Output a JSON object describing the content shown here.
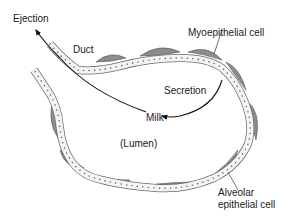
{
  "diagram": {
    "labels": {
      "ejection": "Ejection",
      "duct": "Duct",
      "myoepithelial_cell": "Myoepithelial cell",
      "secretion": "Secretion",
      "milk": "Milk",
      "lumen": "(Lumen)",
      "alveolar_line1": "Alveolar",
      "alveolar_line2": "epithelial cell"
    },
    "colors": {
      "background": "#ffffff",
      "epithelial_fill": "#f4f4f4",
      "epithelial_stroke": "#6a6a6a",
      "myoepithelial_fill": "#8c8c8c",
      "myoepithelial_stroke": "#5a5a5a",
      "nucleus": "#555555",
      "arrow": "#111111",
      "text": "#1a1a1a"
    }
  }
}
